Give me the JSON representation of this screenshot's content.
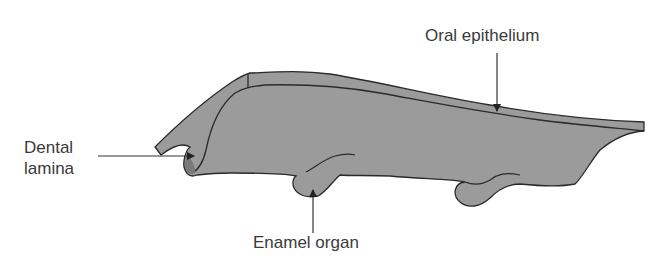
{
  "diagram": {
    "fill_color": "#9a9a9a",
    "outline_color": "#2a2a2a",
    "labels": {
      "dental_lamina_line1": "Dental",
      "dental_lamina_line2": "lamina",
      "enamel_organ": "Enamel organ",
      "oral_epithelium": "Oral epithelium"
    }
  }
}
